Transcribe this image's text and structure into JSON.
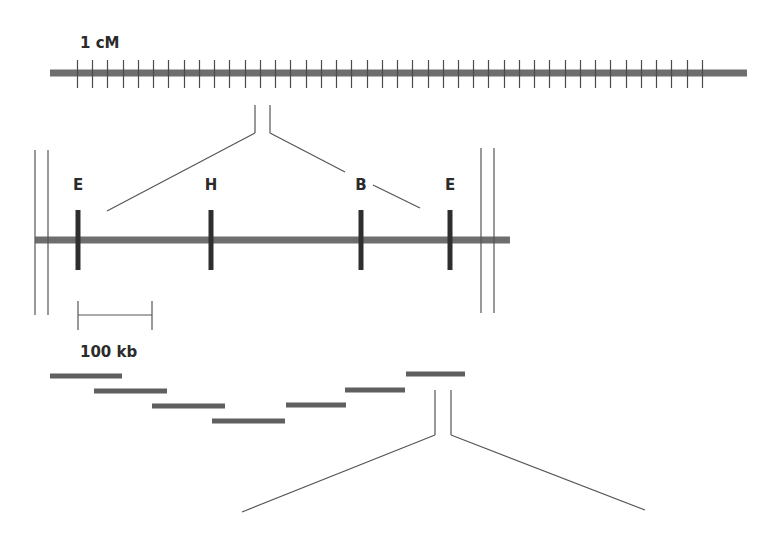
{
  "diagram": {
    "type": "genetic-to-physical-map-zoom",
    "colors": {
      "chromosome_bar": "#6e6e6e",
      "tick": "#4a4a4a",
      "site_marker": "#2e2e2e",
      "contig": "#5f5f5f",
      "line": "#555555",
      "text": "#2b2b2b"
    },
    "genetic_map": {
      "scale_label": "1 cM",
      "bar": {
        "x1": 50,
        "x2": 747,
        "y": 73,
        "height": 7
      },
      "ticks": {
        "x_start": 77,
        "spacing": 15.24,
        "count": 42,
        "y1": 60,
        "y2": 88
      }
    },
    "zoom_1": {
      "verticals": [
        {
          "x": 255,
          "y1": 105,
          "y2": 133
        },
        {
          "x": 270,
          "y1": 105,
          "y2": 133
        }
      ],
      "diagonals": [
        {
          "x1": 255,
          "y1": 133,
          "x2": 107,
          "y2": 211
        },
        {
          "x1": 270,
          "y1": 133,
          "x2": 345,
          "y2": 172
        },
        {
          "x1": 373,
          "y1": 185,
          "x2": 420,
          "y2": 208
        }
      ]
    },
    "restriction_map": {
      "bar": {
        "x1": 35,
        "x2": 510,
        "y": 240,
        "height": 7
      },
      "left_break": [
        {
          "x": 35,
          "y1": 150,
          "y2": 315
        },
        {
          "x": 48,
          "y1": 150,
          "y2": 315
        }
      ],
      "right_break": [
        {
          "x": 481,
          "y1": 148,
          "y2": 313
        },
        {
          "x": 494,
          "y1": 148,
          "y2": 313
        }
      ],
      "sites": [
        {
          "label": "E",
          "x": 78
        },
        {
          "label": "H",
          "x": 211
        },
        {
          "label": "B",
          "x": 361
        },
        {
          "label": "E",
          "x": 450
        }
      ],
      "site_y1": 210,
      "site_y2": 270,
      "label_y": 190
    },
    "scale_bar": {
      "label": "100 kb",
      "x1": 78,
      "x2": 152,
      "y": 315,
      "cap_y1": 301,
      "cap_y2": 330,
      "label_x": 80,
      "label_y": 357
    },
    "contigs": [
      {
        "x1": 50,
        "x2": 122,
        "y": 376
      },
      {
        "x1": 94,
        "x2": 167,
        "y": 391
      },
      {
        "x1": 152,
        "x2": 225,
        "y": 406
      },
      {
        "x1": 212,
        "x2": 285,
        "y": 421
      },
      {
        "x1": 286,
        "x2": 346,
        "y": 405
      },
      {
        "x1": 345,
        "x2": 405,
        "y": 390
      },
      {
        "x1": 406,
        "x2": 465,
        "y": 374
      }
    ],
    "zoom_2": {
      "verticals": [
        {
          "x": 435,
          "y1": 390,
          "y2": 435
        },
        {
          "x": 451,
          "y1": 390,
          "y2": 435
        }
      ],
      "diagonals": [
        {
          "x1": 435,
          "y1": 435,
          "x2": 242,
          "y2": 512
        },
        {
          "x1": 451,
          "y1": 435,
          "x2": 645,
          "y2": 510
        }
      ]
    }
  }
}
